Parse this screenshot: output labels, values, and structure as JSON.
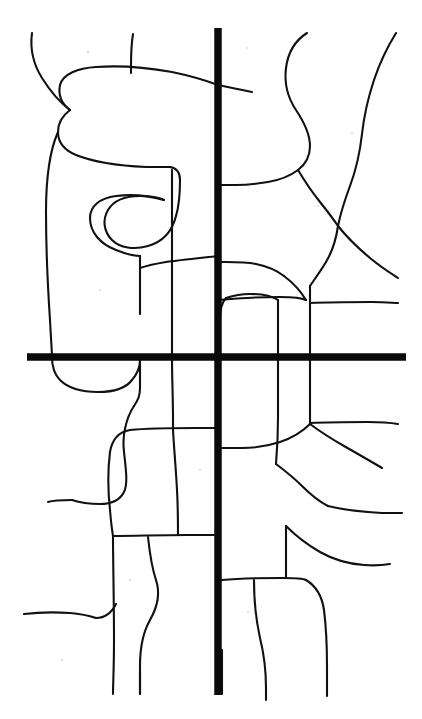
{
  "document": {
    "title": "Hand-drawn street network sketch",
    "kind": "line-art map",
    "width": 422,
    "height": 719,
    "background_color": "#ffffff",
    "ink_color": "#111111",
    "major_road_color": "#0a0a0a"
  },
  "legend": {
    "major_road_label": "major road (thick)",
    "minor_road_label": "minor road (thin)"
  },
  "map": {
    "major_roads": [
      {
        "name": "vertical-arterial",
        "orientation": "vertical",
        "stroke_width": 7.5,
        "path": "M 218 28 L 218 695"
      },
      {
        "name": "horizontal-arterial",
        "orientation": "horizontal",
        "stroke_width": 7.5,
        "path": "M 27 357 L 406 357"
      }
    ],
    "intersection": {
      "x": 218,
      "y": 357
    },
    "minor_roads": [
      {
        "name": "nw-diagonal-from-top-left",
        "path": "M 32 33 C 30 48 32 62 42 78 C 52 94 62 104 70 110"
      },
      {
        "name": "nw-loop-upper",
        "path": "M 70 110 C 62 104 58 95 60 85 C 63 74 78 68 96 67 C 124 65 150 68 172 72 C 196 77 210 82 218 85"
      },
      {
        "name": "nw-loop-top-to-axis",
        "path": "M 218 85 C 232 88 242 90 252 92"
      },
      {
        "name": "nw-stub-vertical-top",
        "path": "M 133 34 C 131 46 131 56 131 66 C 131 70 131 72 131 73"
      },
      {
        "name": "nw-loop-lower-return",
        "path": "M 70 110 C 62 116 58 124 58 132 C 58 142 64 150 76 155 C 96 163 124 166 146 167 C 158 167 166 167 170 167"
      },
      {
        "name": "nw-hook-down",
        "path": "M 170 167 C 176 168 180 172 180 180 C 180 192 179 206 176 216"
      },
      {
        "name": "nw-hook-curl",
        "path": "M 176 216 C 172 232 162 242 148 246 C 134 250 120 248 112 240 C 104 232 102 220 108 210 C 114 200 126 196 140 196 C 152 196 160 198 164 200"
      },
      {
        "name": "nw-curl-inner-to-left",
        "path": "M 164 200 C 150 196 132 194 116 196 C 100 198 90 206 90 218 C 90 232 100 244 116 250 C 126 254 134 256 140 256"
      },
      {
        "name": "west-long-vertical",
        "path": "M 58 132 C 50 150 46 180 46 212 C 46 250 48 290 50 320 C 51 340 52 352 52 357"
      },
      {
        "name": "west-long-vertical-lower",
        "path": "M 52 357 C 52 366 54 374 60 380 C 68 388 82 392 98 392 C 114 392 126 388 132 380 C 138 373 140 366 140 360"
      },
      {
        "name": "mid-left-vertical-down",
        "path": "M 140 360 C 140 368 140 378 140 388 C 140 396 138 400 134 406"
      },
      {
        "name": "mid-left-s-curve",
        "path": "M 134 406 C 126 418 122 436 124 452 C 126 470 128 484 124 492 C 120 500 112 504 100 504 C 88 504 78 502 72 500"
      },
      {
        "name": "nw-inner-to-loop-left",
        "path": "M 140 256 C 140 266 140 280 140 296 C 140 304 140 310 140 314"
      },
      {
        "name": "horiz-upper-left-branch",
        "path": "M 218 256 C 200 258 180 260 166 262 C 154 264 146 266 140 268"
      },
      {
        "name": "upper-mid-vertical",
        "path": "M 172 170 C 172 200 172 240 172 280 C 172 320 172 345 172 357"
      },
      {
        "name": "lower-mid-vertical",
        "path": "M 172 357 C 172 378 173 400 173 418 C 173 424 173 428 173 430"
      },
      {
        "name": "mid-box-top",
        "path": "M 130 430 C 150 428 176 428 196 428 C 208 428 214 428 218 428"
      },
      {
        "name": "mid-box-left-curve",
        "path": "M 130 430 C 118 432 112 440 110 452 C 108 468 108 492 110 510 C 111 522 112 530 113 536"
      },
      {
        "name": "mid-box-bottom",
        "path": "M 113 536 C 134 536 160 535 186 535 C 202 535 212 535 218 535"
      },
      {
        "name": "mid-small-vertical",
        "path": "M 173 430 C 174 448 176 470 177 490 C 178 508 178 524 178 535"
      },
      {
        "name": "mid-box-left-down",
        "path": "M 113 536 C 113 560 114 600 114 640 C 114 668 113 684 113 694"
      },
      {
        "name": "lower-left-stub",
        "path": "M 148 537 C 150 556 152 568 156 580 C 160 592 158 606 150 620 C 142 634 140 650 140 666 C 140 678 140 688 140 694"
      },
      {
        "name": "lower-left-horizontal",
        "path": "M 24 614 C 40 612 56 612 70 613 C 82 614 90 616 96 618"
      },
      {
        "name": "lower-left-join",
        "path": "M 96 618 C 106 618 112 612 116 604"
      },
      {
        "name": "west-bottom-tail",
        "path": "M 72 500 C 62 500 54 500 48 502"
      },
      {
        "name": "ne-squiggle-left",
        "path": "M 307 33 C 296 40 288 52 286 68 C 284 84 288 98 296 110 C 304 122 310 134 310 146 C 310 156 306 164 298 170"
      },
      {
        "name": "ne-squiggle-to-junction",
        "path": "M 298 170 C 290 176 280 180 268 182 C 256 184 244 185 236 185 C 228 185 222 185 218 185"
      },
      {
        "name": "ne-junction-down",
        "path": "M 298 170 C 304 180 312 192 320 202 C 328 212 334 220 338 226"
      },
      {
        "name": "ne-right-squiggle",
        "path": "M 396 33 C 388 46 380 62 374 80 C 368 98 364 116 362 134 C 360 152 356 170 350 186 C 344 202 340 216 338 226"
      },
      {
        "name": "ne-junction-to-right-edge",
        "path": "M 338 226 C 346 236 358 248 370 258 C 382 268 392 274 398 278"
      },
      {
        "name": "ne-below-junction",
        "path": "M 338 226 C 336 240 332 252 326 262 C 320 272 314 280 310 286"
      },
      {
        "name": "east-mid-vertical",
        "path": "M 310 286 C 310 300 310 318 310 334 C 310 348 310 354 310 357"
      },
      {
        "name": "horiz-right-of-axis-upper",
        "path": "M 218 300 C 240 298 262 297 280 297 C 294 297 302 298 306 300"
      },
      {
        "name": "east-upper-curve",
        "path": "M 306 300 C 300 290 292 282 284 276"
      },
      {
        "name": "east-box-top-curve",
        "path": "M 284 276 C 276 270 266 266 256 264 C 246 262 234 262 226 262 C 221 262 219 262 218 262"
      },
      {
        "name": "east-inner-vertical",
        "path": "M 278 300 C 278 316 278 332 278 344 C 278 352 278 356 278 357"
      },
      {
        "name": "east-inner-box-left",
        "path": "M 278 300 C 272 296 262 294 250 294 C 240 294 232 296 226 298"
      },
      {
        "name": "east-inner-corner",
        "path": "M 226 298 C 222 302 220 310 220 320"
      },
      {
        "name": "east-right-horizontal",
        "path": "M 310 303 C 330 302 352 302 372 302 C 386 302 394 303 398 303"
      },
      {
        "name": "east-lower-vertical-1",
        "path": "M 310 357 C 310 372 310 390 310 404 C 310 414 310 420 310 424"
      },
      {
        "name": "east-lower-vertical-2",
        "path": "M 278 357 C 278 378 278 400 278 418 C 278 436 277 452 276 464"
      },
      {
        "name": "east-lower-branch",
        "path": "M 310 424 C 318 430 330 438 344 446 C 358 454 372 462 382 468"
      },
      {
        "name": "east-lower-curve-left",
        "path": "M 310 424 C 302 432 292 438 280 442 C 268 446 254 448 242 448 C 232 448 226 448 222 448"
      },
      {
        "name": "east-horizontal-mid",
        "path": "M 310 423 C 330 422 350 422 368 422 C 382 422 392 423 398 424"
      },
      {
        "name": "east-lower-to-right",
        "path": "M 276 464 C 284 470 294 478 302 486 C 312 496 320 502 328 506"
      },
      {
        "name": "east-lower-right-tail",
        "path": "M 328 506 C 344 510 364 512 382 513 C 392 513 398 513 402 513"
      },
      {
        "name": "south-center-box-top",
        "path": "M 222 580 C 242 578 264 578 282 578 C 294 578 302 578 306 580"
      },
      {
        "name": "south-center-box-right",
        "path": "M 306 580 C 316 586 322 596 324 610 C 326 626 327 646 327 666 C 327 682 327 690 327 696"
      },
      {
        "name": "south-center-inner-vertical",
        "path": "M 254 580 C 254 600 256 620 260 638 C 264 654 266 672 266 688 C 266 694 266 698 266 700"
      },
      {
        "name": "south-center-stub-up",
        "path": "M 286 578 C 286 562 286 550 286 540 C 286 532 286 528 286 526"
      },
      {
        "name": "south-right-curve",
        "path": "M 286 526 C 294 534 306 544 320 552 C 334 560 350 564 364 565 C 376 566 384 565 390 564"
      },
      {
        "name": "south-left-of-axis-stub",
        "path": "M 222 694 C 222 680 222 664 222 650"
      },
      {
        "name": "bottom-left-short",
        "path": "M 140 694 C 140 688 140 680 140 672"
      }
    ],
    "specks": [
      {
        "x": 88,
        "y": 52,
        "r": 1.2
      },
      {
        "x": 247,
        "y": 48,
        "r": 1.0
      },
      {
        "x": 352,
        "y": 133,
        "r": 1.0
      },
      {
        "x": 100,
        "y": 290,
        "r": 1.0
      },
      {
        "x": 318,
        "y": 206,
        "r": 1.0
      },
      {
        "x": 200,
        "y": 470,
        "r": 1.0
      },
      {
        "x": 62,
        "y": 660,
        "r": 1.0
      },
      {
        "x": 248,
        "y": 612,
        "r": 1.0
      },
      {
        "x": 130,
        "y": 580,
        "r": 1.0
      }
    ]
  }
}
